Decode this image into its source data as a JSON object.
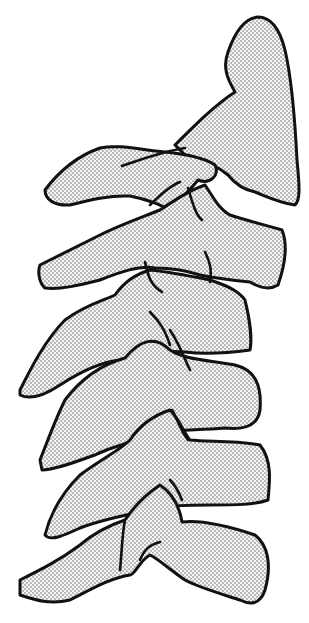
{
  "figure": {
    "colors": {
      "background": "#ffffff",
      "outline": "#111111",
      "stipple": "#555555"
    },
    "parts": [
      {
        "id": "skull-base",
        "label": "Skull base / occiput"
      },
      {
        "id": "vertebra-1",
        "label": "Vertebra 1"
      },
      {
        "id": "vertebra-2",
        "label": "Vertebra 2"
      },
      {
        "id": "vertebra-3",
        "label": "Vertebra 3"
      },
      {
        "id": "vertebra-4",
        "label": "Vertebra 4"
      },
      {
        "id": "vertebra-5",
        "label": "Vertebra 5"
      },
      {
        "id": "vertebra-6",
        "label": "Vertebra 6"
      }
    ]
  }
}
